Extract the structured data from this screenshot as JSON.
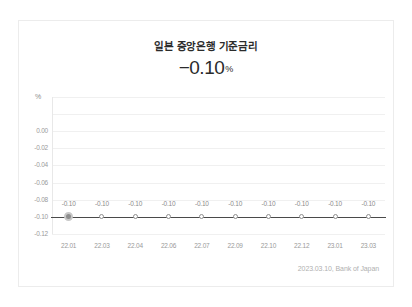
{
  "card": {
    "title": "일본 중앙은행 기준금리",
    "headline_value": "−0.10",
    "headline_unit": "%",
    "footer_note": "2023.03.10,  Bank of Japan"
  },
  "chart_data": {
    "type": "line",
    "title": "일본 중앙은행 기준금리",
    "xlabel": "",
    "ylabel": "%",
    "axis_unit": "%",
    "categories": [
      "22.01",
      "22.03",
      "22.04",
      "22.06",
      "22.07",
      "22.09",
      "22.10",
      "22.12",
      "23.01",
      "23.03"
    ],
    "values": [
      -0.1,
      -0.1,
      -0.1,
      -0.1,
      -0.1,
      -0.1,
      -0.1,
      -0.1,
      -0.1,
      -0.1
    ],
    "point_labels": [
      "-0.10",
      "-0.10",
      "-0.10",
      "-0.10",
      "-0.10",
      "-0.10",
      "-0.10",
      "-0.10",
      "-0.10",
      "-0.10"
    ],
    "ylim": [
      -0.12,
      0.0
    ],
    "yticks": [
      0.0,
      -0.02,
      -0.04,
      -0.06,
      -0.08,
      -0.1,
      -0.12
    ],
    "ytick_labels": [
      "0.00",
      "-0.02",
      "-0.04",
      "-0.06",
      "-0.08",
      "-0.10",
      "-0.12"
    ],
    "grid": true,
    "legend": false,
    "series_color": "#4a4a4a",
    "marker_color": "#8e8e8e",
    "highlight_index": 0
  }
}
